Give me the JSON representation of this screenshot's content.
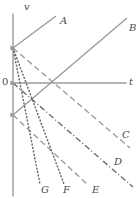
{
  "figure": {
    "type": "line-graph",
    "background_color": "#ffffff",
    "stroke_color": "#9a9a9a",
    "label_color": "#4a4a4a",
    "width": 140,
    "height": 198
  },
  "axes": {
    "vertical": {
      "label": "v",
      "label_x": 24,
      "label_y": 2,
      "x": 13,
      "y_top": 14,
      "y_bottom": 196
    },
    "horizontal": {
      "label": "t",
      "label_x": 129,
      "label_y": 77,
      "y": 83,
      "x_left": 13,
      "x_right": 126
    },
    "origin": {
      "label": "0",
      "label_x": 2,
      "label_y": 77,
      "x": 13,
      "y": 83
    }
  },
  "nodes": [
    {
      "name": "upper-intercept",
      "x": 13,
      "y": 48
    },
    {
      "name": "origin-node",
      "x": 13,
      "y": 83
    },
    {
      "name": "lower-intercept",
      "x": 13,
      "y": 115
    },
    {
      "name": "crossing-node",
      "x": 55,
      "y": 83
    }
  ],
  "chart_data": {
    "type": "line",
    "title": "",
    "xlabel": "t",
    "ylabel": "v",
    "grid": false,
    "legend": "inline-end-labels",
    "series": [
      {
        "name": "A",
        "style": "solid",
        "color": "#9a9a9a",
        "x1": 13,
        "y1": 48,
        "x2": 56,
        "y2": 16,
        "label": "A",
        "label_x": 60,
        "label_y": 16
      },
      {
        "name": "B",
        "style": "solid",
        "color": "#9a9a9a",
        "x1": 13,
        "y1": 115,
        "x2": 127,
        "y2": 18,
        "label": "B",
        "label_x": 129,
        "label_y": 23
      },
      {
        "name": "C",
        "style": "dashed",
        "color": "#9a9a9a",
        "x1": 13,
        "y1": 48,
        "x2": 130,
        "y2": 148,
        "label": "C",
        "label_x": 122,
        "label_y": 130
      },
      {
        "name": "D",
        "style": "dash-dot",
        "color": "#6a6a6a",
        "x1": 13,
        "y1": 83,
        "x2": 133,
        "y2": 187,
        "label": "D",
        "label_x": 114,
        "label_y": 157
      },
      {
        "name": "E",
        "style": "dashed",
        "color": "#9a9a9a",
        "x1": 13,
        "y1": 115,
        "x2": 88,
        "y2": 185,
        "label": "E",
        "label_x": 92,
        "label_y": 185
      },
      {
        "name": "F",
        "style": "dotted",
        "color": "#6a6a6a",
        "x1": 13,
        "y1": 48,
        "x2": 64,
        "y2": 184,
        "label": "F",
        "label_x": 63,
        "label_y": 185
      },
      {
        "name": "G",
        "style": "dotted",
        "color": "#6a6a6a",
        "x1": 13,
        "y1": 48,
        "x2": 40,
        "y2": 184,
        "label": "G",
        "label_x": 41,
        "label_y": 185
      }
    ]
  }
}
